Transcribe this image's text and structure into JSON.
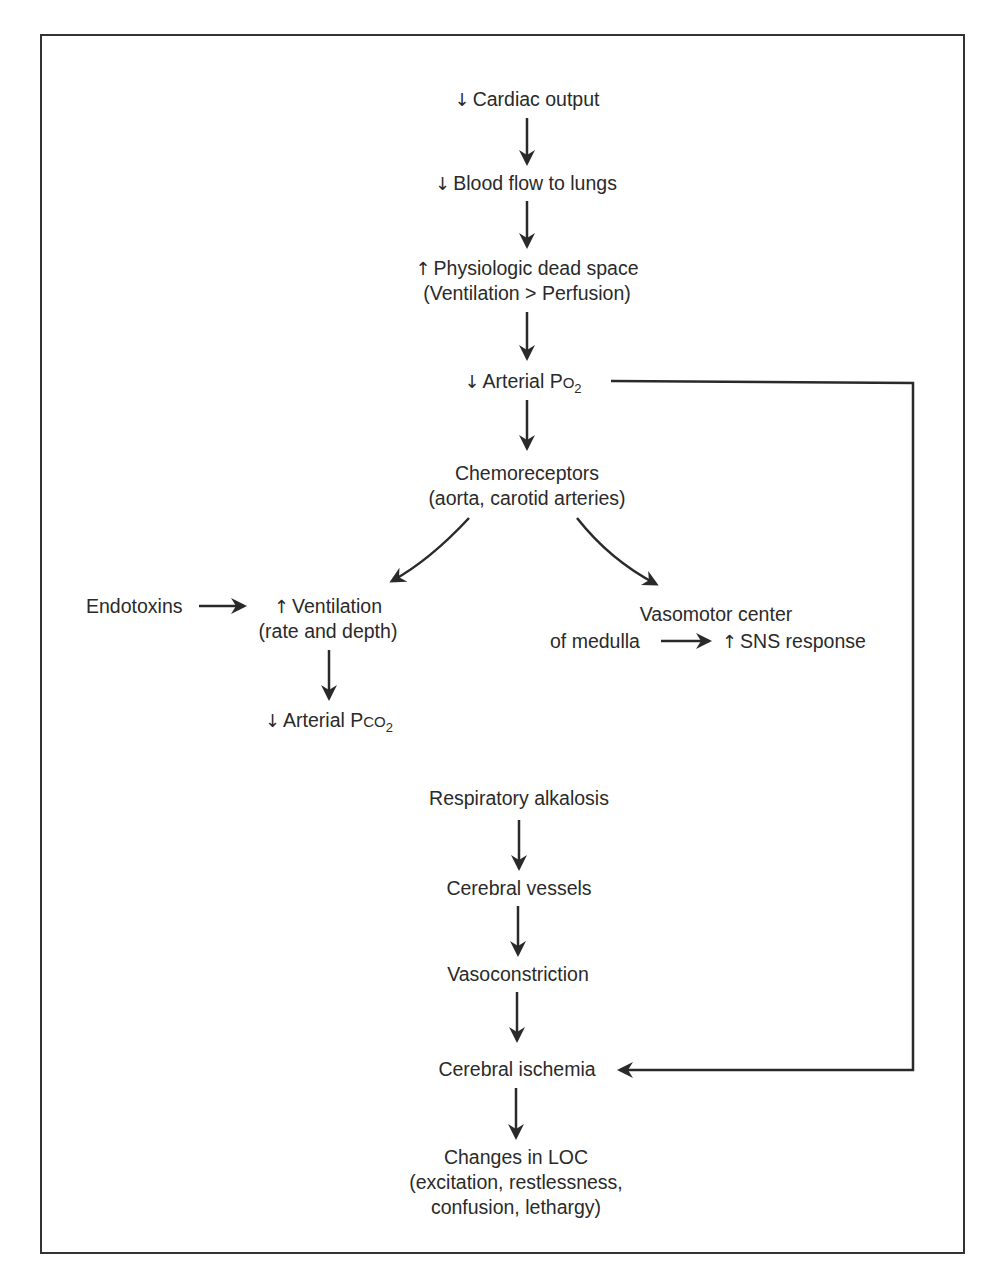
{
  "diagram": {
    "type": "flowchart",
    "nodes": {
      "cardiac_output": {
        "symbol": "↓",
        "text": "Cardiac output"
      },
      "blood_flow": {
        "symbol": "↓",
        "text": "Blood flow to lungs"
      },
      "dead_space": {
        "symbol": "↑",
        "line1": "Physiologic dead space",
        "line2": "(Ventilation > Perfusion)"
      },
      "arterial_po2": {
        "symbol": "↓",
        "text": "Arterial P",
        "small": "O",
        "sub": "2"
      },
      "chemoreceptors": {
        "line1": "Chemoreceptors",
        "line2": "(aorta, carotid arteries)"
      },
      "endotoxins": {
        "text": "Endotoxins"
      },
      "ventilation": {
        "symbol": "↑",
        "line1": "Ventilation",
        "line2": "(rate and depth)"
      },
      "arterial_pco2": {
        "symbol": "↓",
        "text": "Arterial P",
        "small": "CO",
        "sub": "2"
      },
      "vasomotor": {
        "line1": "Vasomotor center",
        "line2": "of medulla"
      },
      "sns": {
        "symbol": "↑",
        "text": "SNS response"
      },
      "resp_alkalosis": {
        "text": "Respiratory alkalosis"
      },
      "cerebral_vessels": {
        "text": "Cerebral vessels"
      },
      "vasoconstriction": {
        "text": "Vasoconstriction"
      },
      "cerebral_ischemia": {
        "text": "Cerebral ischemia"
      },
      "loc_changes": {
        "line1": "Changes in LOC",
        "line2": "(excitation, restlessness,",
        "line3": "confusion, lethargy)"
      }
    },
    "edges": [
      [
        "cardiac_output",
        "blood_flow"
      ],
      [
        "blood_flow",
        "dead_space"
      ],
      [
        "dead_space",
        "arterial_po2"
      ],
      [
        "arterial_po2",
        "chemoreceptors"
      ],
      [
        "arterial_po2",
        "cerebral_ischemia"
      ],
      [
        "chemoreceptors",
        "ventilation"
      ],
      [
        "chemoreceptors",
        "vasomotor"
      ],
      [
        "endotoxins",
        "ventilation"
      ],
      [
        "ventilation",
        "arterial_pco2"
      ],
      [
        "vasomotor",
        "sns"
      ],
      [
        "resp_alkalosis",
        "cerebral_vessels"
      ],
      [
        "cerebral_vessels",
        "vasoconstriction"
      ],
      [
        "vasoconstriction",
        "cerebral_ischemia"
      ],
      [
        "cerebral_ischemia",
        "loc_changes"
      ]
    ],
    "colors": {
      "line": "#2a2a2a",
      "text": "#2a2a2a",
      "background": "#ffffff"
    }
  }
}
